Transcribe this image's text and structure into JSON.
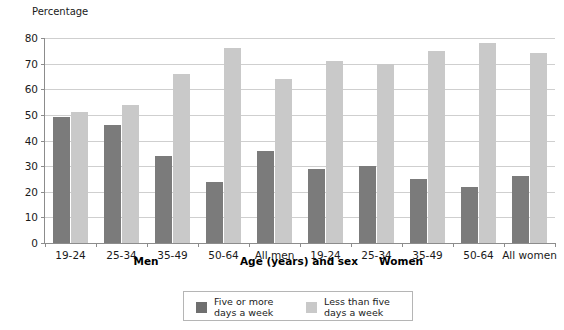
{
  "chart_data": {
    "type": "bar",
    "title": "",
    "ylabel": "Percentage",
    "xlabel": "Age (years) and sex",
    "ylim": [
      0,
      80
    ],
    "ytick_step": 10,
    "grid": true,
    "legend_position": "bottom-center",
    "categories": [
      "19-24",
      "25-34",
      "35-49",
      "50-64",
      "All men",
      "19-24",
      "25-34",
      "35-49",
      "50-64",
      "All women"
    ],
    "group_labels": [
      {
        "text": "Men",
        "span_start": 0,
        "span_end": 3
      },
      {
        "text": "Women",
        "span_start": 5,
        "span_end": 8
      }
    ],
    "series": [
      {
        "name": "Five or more\ndays a week",
        "color": "#7b7b7b",
        "values": [
          49,
          46,
          34,
          24,
          36,
          29,
          30,
          25,
          22,
          26
        ]
      },
      {
        "name": "Less than five\ndays a week",
        "color": "#c9c9c9",
        "values": [
          51,
          54,
          66,
          76,
          64,
          71,
          70,
          75,
          78,
          74
        ]
      }
    ],
    "ytick_labels": [
      "0",
      "10",
      "20",
      "30",
      "40",
      "50",
      "60",
      "70",
      "80"
    ]
  },
  "axis": {
    "y_title": "Percentage",
    "x_title": "Age (years) and sex"
  },
  "legend": {
    "items": [
      {
        "label": "Five or more\ndays a week",
        "color": "#7b7b7b"
      },
      {
        "label": "Less than five\ndays a week",
        "color": "#c9c9c9"
      }
    ]
  },
  "colors": {
    "series_dark": "#7b7b7b",
    "series_light": "#c9c9c9",
    "gridline": "#cfcfcf",
    "axis": "#8c8c8c",
    "text": "#1a1a1a"
  }
}
